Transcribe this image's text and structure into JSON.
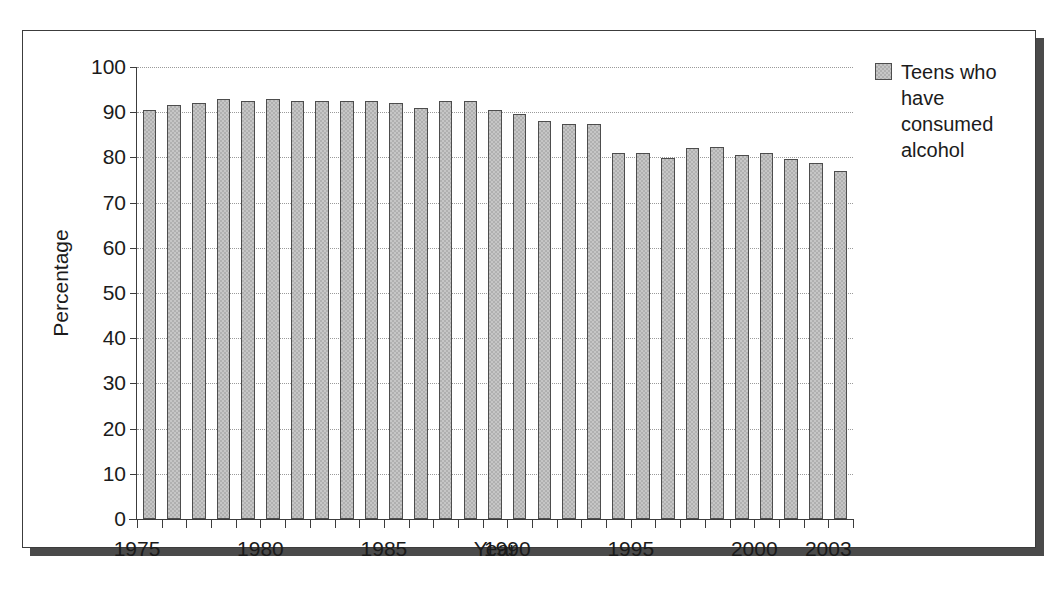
{
  "chart_data": {
    "type": "bar",
    "title": "",
    "xlabel": "Year",
    "ylabel": "Percentage",
    "ylim": [
      0,
      100
    ],
    "ytick_step": 10,
    "yticks": [
      0,
      10,
      20,
      30,
      40,
      50,
      60,
      70,
      80,
      90,
      100
    ],
    "ytick_labels": [
      "0",
      "10",
      "20",
      "30",
      "40",
      "50",
      "60",
      "70",
      "80",
      "90",
      "100"
    ],
    "xlim": [
      1974.5,
      2003.5
    ],
    "grid": "horizontal-dotted",
    "legend_position": "right",
    "legend": [
      "Teens who have consumed alcohol"
    ],
    "categories": [
      "1975",
      "1976",
      "1977",
      "1978",
      "1979",
      "1980",
      "1981",
      "1982",
      "1983",
      "1984",
      "1985",
      "1986",
      "1987",
      "1988",
      "1989",
      "1990",
      "1991",
      "1992",
      "1993",
      "1994",
      "1995",
      "1996",
      "1997",
      "1998",
      "1999",
      "2000",
      "2001",
      "2002",
      "2003"
    ],
    "xtick_labels": [
      "1975",
      "1980",
      "1985",
      "1990",
      "1995",
      "2000",
      "2003"
    ],
    "series": [
      {
        "name": "Teens who have consumed alcohol",
        "values": [
          90.5,
          91.5,
          92.0,
          93.0,
          92.5,
          93.0,
          92.5,
          92.5,
          92.5,
          92.5,
          92.0,
          91.0,
          92.5,
          92.5,
          90.5,
          89.5,
          88.0,
          87.5,
          87.5,
          81.0,
          81.0,
          79.8,
          82.0,
          82.2,
          80.5,
          81.0,
          79.7,
          78.8,
          77.0
        ]
      }
    ]
  },
  "legend": {
    "swatch_name": "legend-swatch",
    "label": "Teens who have consumed alcohol"
  },
  "axes": {
    "y_title": "Percentage",
    "x_title": "Year"
  },
  "colors": {
    "bar_fill": "#c6c6c6",
    "bar_edge": "#4d4d4d",
    "axis": "#3c3c3c",
    "grid": "#9a9a9a",
    "frame": "#3c3c3c",
    "shadow": "#4a4a4a",
    "text": "#1b1b1b",
    "background": "#ffffff"
  }
}
